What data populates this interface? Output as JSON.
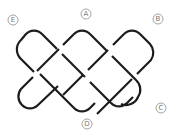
{
  "diagram": {
    "type": "knot-diagram",
    "stroke_color": "#1c1c1c",
    "label_color": "#7a7a7a",
    "labels": [
      {
        "id": "A",
        "text": "A",
        "x": 86,
        "y": 14
      },
      {
        "id": "B",
        "text": "B",
        "x": 158,
        "y": 19
      },
      {
        "id": "C",
        "text": "C",
        "x": 161,
        "y": 108
      },
      {
        "id": "D",
        "text": "D",
        "x": 87,
        "y": 124
      },
      {
        "id": "E",
        "text": "E",
        "x": 13,
        "y": 20
      }
    ]
  }
}
